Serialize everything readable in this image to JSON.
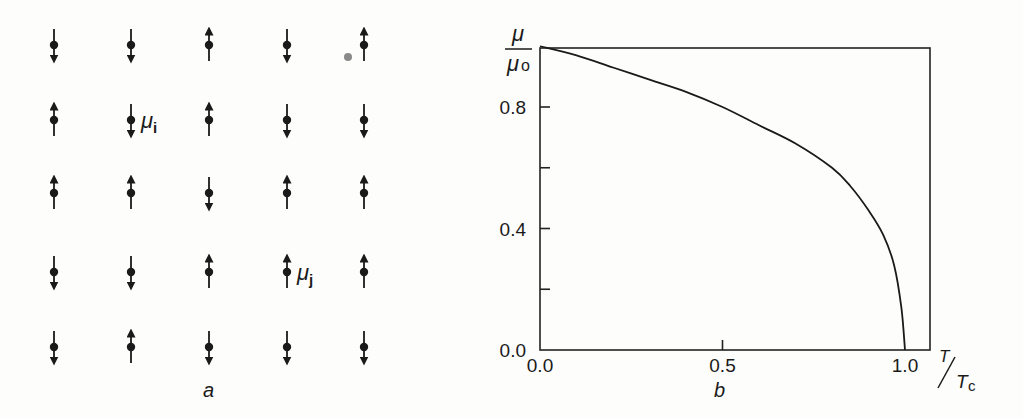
{
  "panel_a": {
    "caption": "a",
    "grid": {
      "columns_x": [
        54,
        131,
        209,
        287,
        364
      ],
      "rows_y": [
        45,
        120,
        193,
        272,
        347
      ],
      "spins": [
        [
          "down",
          "down",
          "up",
          "down",
          "up"
        ],
        [
          "up",
          "down",
          "up",
          "down",
          "down"
        ],
        [
          "up",
          "up",
          "down",
          "up",
          "up"
        ],
        [
          "down",
          "down",
          "up",
          "up",
          "up"
        ],
        [
          "down",
          "up",
          "down",
          "down",
          "down"
        ]
      ]
    },
    "labels": {
      "mu_i": {
        "symbol": "μ",
        "sub": "i",
        "row": 1,
        "col": 1
      },
      "mu_j": {
        "symbol": "μ",
        "sub": "j",
        "row": 3,
        "col": 3
      }
    }
  },
  "panel_b": {
    "caption": "b",
    "ylabel_num": "μ",
    "ylabel_den": "μ",
    "ylabel_den_sub": "o",
    "xlabel_num": "T",
    "xlabel_den": "T",
    "xlabel_den_sub": "c",
    "yticks": [
      "0.0",
      "0.4",
      "0.8"
    ],
    "xticks": [
      "0.0",
      "0.5",
      "1.0"
    ]
  },
  "chart_data": {
    "type": "line",
    "title": "",
    "xlabel": "T/Tc",
    "ylabel": "μ/μo",
    "xlim": [
      0.0,
      1.07
    ],
    "ylim": [
      0.0,
      1.0
    ],
    "xticks": [
      0.0,
      0.5,
      1.0
    ],
    "yticks": [
      0.0,
      0.4,
      0.8
    ],
    "minor_yticks": [
      0.2,
      0.6
    ],
    "grid": false,
    "series": [
      {
        "name": "spontaneous magnetization",
        "x": [
          0.0,
          0.1,
          0.2,
          0.3,
          0.4,
          0.5,
          0.6,
          0.7,
          0.8,
          0.85,
          0.9,
          0.94,
          0.97,
          0.99,
          1.0
        ],
        "y": [
          1.0,
          0.97,
          0.93,
          0.89,
          0.85,
          0.8,
          0.74,
          0.68,
          0.6,
          0.54,
          0.46,
          0.38,
          0.28,
          0.14,
          0.0
        ]
      }
    ]
  }
}
